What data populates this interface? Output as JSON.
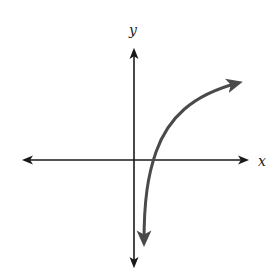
{
  "figure": {
    "type": "coordinate-plane-sketch",
    "x_axis_label": "x",
    "y_axis_label": "y",
    "colors": {
      "axes": "#1a1a1a",
      "curve": "#4a4a4a",
      "background": "#ffffff"
    },
    "curve": {
      "description": "Increasing concave-down curve (logarithmic shape) with vertical asymptote just right of the y-axis, crossing the x-axis to the right of the origin, arrows at both ends",
      "x_intercept_position": "right of origin",
      "end_behavior": {
        "left_end": "arrow pointing down near y-axis",
        "right_end": "arrow pointing right, rising slowly"
      }
    }
  }
}
